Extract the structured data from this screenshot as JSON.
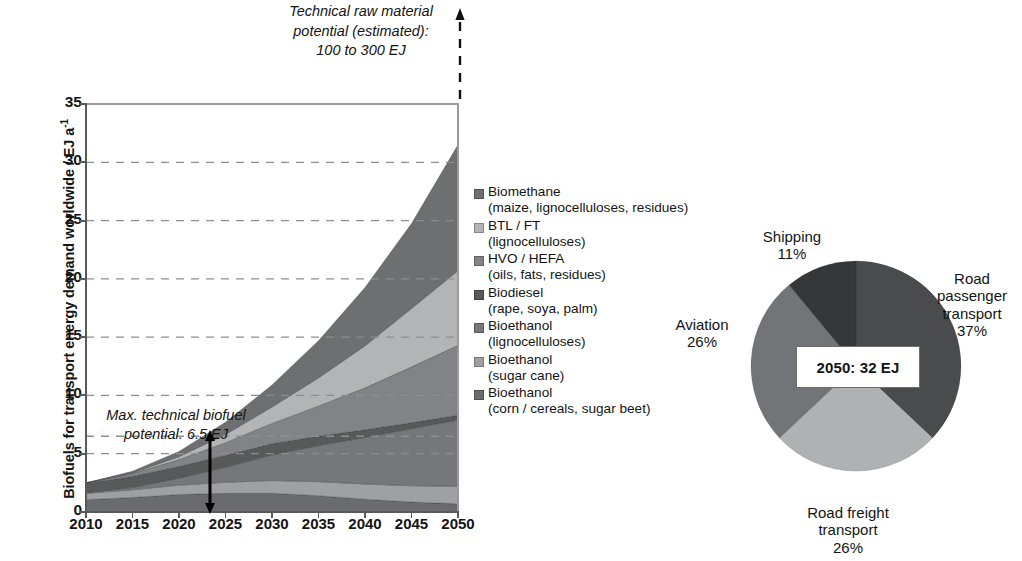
{
  "axis": {
    "ylabel_main": "Biofuels for transport energy demand worldwide / EJ a",
    "ylabel_exponent": "-1",
    "yticks": [
      "0",
      "5",
      "10",
      "15",
      "20",
      "25",
      "30",
      "35"
    ],
    "xticks": [
      "2010",
      "2015",
      "2020",
      "2025",
      "2030",
      "2035",
      "2040",
      "2045",
      "2050"
    ]
  },
  "annotations": {
    "top": {
      "line1": "Technical raw material",
      "line2": "potential (estimated):",
      "line3": "100 to 300 EJ"
    },
    "inplot": {
      "line1": "Max. technical biofuel",
      "line2": "potential: 6.5 EJ"
    }
  },
  "legend": {
    "items": [
      {
        "name": "Biomethane",
        "detail": "(maize, lignocelluloses, residues)",
        "color": "#6e6f71"
      },
      {
        "name": "BTL / FT",
        "detail": "(lignocelluloses)",
        "color": "#b3b4b6"
      },
      {
        "name": "HVO / HEFA",
        "detail": "(oils, fats, residues)",
        "color": "#828386"
      },
      {
        "name": "Biodiesel",
        "detail": "(rape, soya, palm)",
        "color": "#58595b"
      },
      {
        "name": "Bioethanol",
        "detail": "(lignocelluloses)",
        "color": "#76777a"
      },
      {
        "name": "Bioethanol",
        "detail": "(sugar cane)",
        "color": "#9fa0a3"
      },
      {
        "name": "Bioethanol",
        "detail": "(corn / cereals, sugar beet)",
        "color": "#6a6b6e"
      }
    ]
  },
  "pie": {
    "center_label": "2050: 32 EJ",
    "slices": [
      {
        "label": "Road passenger transport",
        "label_lines": [
          "Road",
          "passenger",
          "transport"
        ],
        "value": 37,
        "pct_text": "37%",
        "color": "#4a4b4d"
      },
      {
        "label": "Road freight transport",
        "label_lines": [
          "Road freight",
          "transport"
        ],
        "value": 26,
        "pct_text": "26%",
        "color": "#b0b1b3"
      },
      {
        "label": "Aviation",
        "label_lines": [
          "Aviation"
        ],
        "value": 26,
        "pct_text": "26%",
        "color": "#737477"
      },
      {
        "label": "Shipping",
        "label_lines": [
          "Shipping"
        ],
        "value": 11,
        "pct_text": "11%",
        "color": "#363738"
      }
    ]
  },
  "chart_data": {
    "type": "area",
    "title": "Biofuels for transport energy demand worldwide",
    "xlabel": "",
    "ylabel": "Biofuels for transport energy demand worldwide / EJ a-1",
    "xlim": [
      2010,
      2050
    ],
    "ylim": [
      0,
      35
    ],
    "grid": "horizontal-dashed",
    "gridlines": [
      5,
      10,
      15,
      20,
      25,
      30
    ],
    "extra_gridline": 6.5,
    "legend_position": "right",
    "x": [
      2010,
      2015,
      2020,
      2025,
      2030,
      2035,
      2040,
      2045,
      2050
    ],
    "stack_order_bottom_to_top": [
      "Bioethanol (corn / cereals, sugar beet)",
      "Bioethanol (sugar cane)",
      "Bioethanol (lignocelluloses)",
      "Biodiesel (rape, soya, palm)",
      "HVO / HEFA (oils, fats, residues)",
      "BTL / FT (lignocelluloses)",
      "Biomethane (maize, lignocelluloses, residues)"
    ],
    "series": [
      {
        "name": "Bioethanol (corn / cereals, sugar beet)",
        "color": "#6a6b6e",
        "values": [
          1.05,
          1.25,
          1.5,
          1.6,
          1.6,
          1.4,
          1.1,
          0.85,
          0.7
        ]
      },
      {
        "name": "Bioethanol (sugar cane)",
        "color": "#9fa0a3",
        "values": [
          0.55,
          0.65,
          0.8,
          0.95,
          1.1,
          1.2,
          1.3,
          1.4,
          1.5
        ]
      },
      {
        "name": "Bioethanol (lignocelluloses)",
        "color": "#76777a",
        "values": [
          0.05,
          0.2,
          0.6,
          1.3,
          2.2,
          3.1,
          4.0,
          4.9,
          5.7
        ]
      },
      {
        "name": "Biodiesel (rape, soya, palm)",
        "color": "#58595b",
        "values": [
          0.8,
          0.95,
          1.0,
          1.0,
          0.95,
          0.8,
          0.65,
          0.5,
          0.4
        ]
      },
      {
        "name": "HVO / HEFA (oils, fats, residues)",
        "color": "#828386",
        "values": [
          0.05,
          0.25,
          0.6,
          1.1,
          1.75,
          2.6,
          3.6,
          4.8,
          6.0
        ]
      },
      {
        "name": "BTL / FT (lignocelluloses)",
        "color": "#b3b4b6",
        "values": [
          0.0,
          0.05,
          0.25,
          0.7,
          1.4,
          2.4,
          3.6,
          5.0,
          6.4
        ]
      },
      {
        "name": "Biomethane (maize, lignocelluloses, residues)",
        "color": "#6e6f71",
        "values": [
          0.0,
          0.15,
          0.45,
          1.05,
          1.9,
          3.2,
          5.0,
          7.3,
          10.8
        ]
      }
    ],
    "totals": [
      2.5,
      3.5,
      5.2,
      7.7,
      10.9,
      14.7,
      19.25,
      24.75,
      31.5
    ],
    "reference_line": {
      "name": "Max. technical biofuel potential",
      "value": 6.5,
      "unit": "EJ"
    },
    "marker_arrow": {
      "at_x": 2020,
      "from": 0,
      "to": 6.5
    }
  },
  "chart_data_pie": {
    "type": "pie",
    "title": "2050: 32 EJ",
    "labels": [
      "Road passenger transport",
      "Road freight transport",
      "Aviation",
      "Shipping"
    ],
    "values": [
      37,
      26,
      26,
      11
    ],
    "unit": "%"
  }
}
